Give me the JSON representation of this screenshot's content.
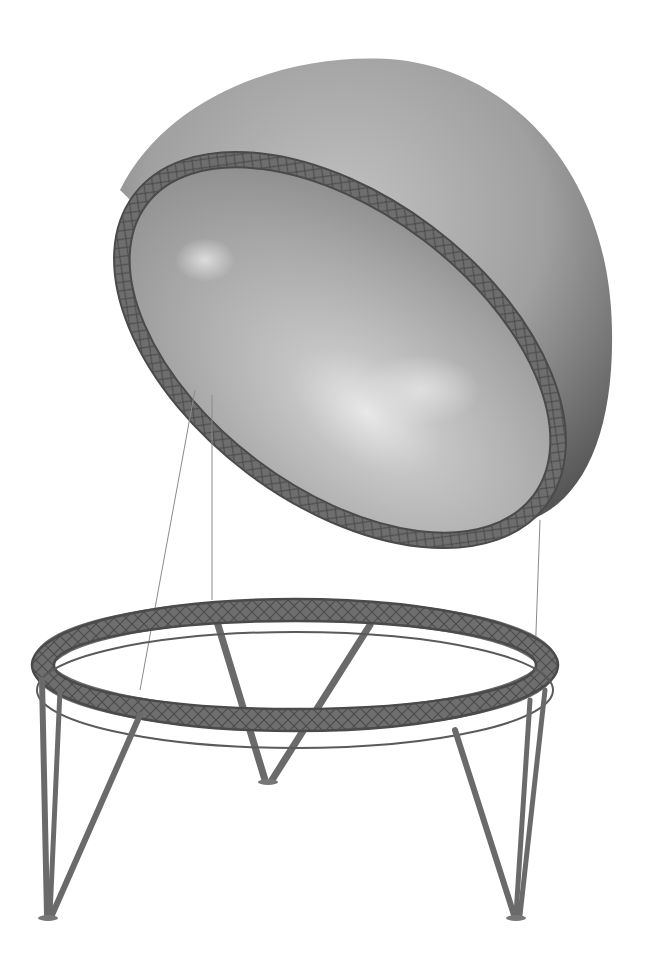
{
  "image": {
    "subject": "dome-on-truss-ring-render",
    "background": "#ffffff",
    "colors": {
      "dome_light": "#bdbdbd",
      "dome_mid": "#9a9a9a",
      "dome_dark": "#5a5a5a",
      "dome_inner": "#a8a8a8",
      "dome_inner_highlight": "#e4e4e4",
      "truss": "#6e6e6e",
      "truss_dark": "#4a4a4a",
      "cable": "#8a8a8a"
    },
    "components": [
      {
        "id": "dome",
        "label": "hemispherical-dome-shell"
      },
      {
        "id": "dome-truss-ring",
        "label": "dome-edge-truss-ring"
      },
      {
        "id": "cables",
        "label": "suspension-cables",
        "count": 3
      },
      {
        "id": "base-truss-ring",
        "label": "base-circular-truss-ring"
      },
      {
        "id": "legs",
        "label": "tripod-legs",
        "count": 3
      }
    ]
  }
}
